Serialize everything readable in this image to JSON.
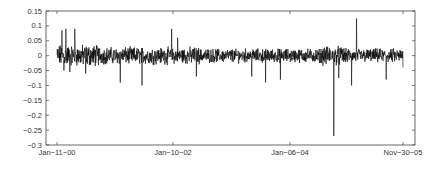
{
  "chart_data": {
    "type": "line",
    "title": "",
    "xlabel": "",
    "ylabel": "",
    "ylim": [
      -0.3,
      0.15
    ],
    "yticks": [
      0.15,
      0.1,
      0.05,
      0,
      -0.05,
      -0.1,
      -0.15,
      -0.2,
      -0.25,
      -0.3
    ],
    "ytick_labels": [
      "0.15",
      "0.1",
      "0.05",
      "0",
      "-0.05",
      "-0.1",
      "-0.15",
      "-0.2",
      "-0.25",
      "-0.3"
    ],
    "xticks": [
      "Jan-11-00",
      "Jan-10-02",
      "Jan-06-04",
      "Nov-30-05"
    ],
    "grid": false,
    "legend": null,
    "series": [
      {
        "name": "daily returns",
        "color": "#000000",
        "description": "Noisy daily return series fluctuating around 0 (mostly within ±0.05) from Jan-11-00 to Nov-30-05",
        "notable_points": [
          {
            "x": "early 2000",
            "y": 0.085
          },
          {
            "x": "early 2000",
            "y": 0.09
          },
          {
            "x": "late 2001",
            "y": 0.09
          },
          {
            "x": "mid 2001",
            "y": -0.09
          },
          {
            "x": "early 2002",
            "y": -0.1
          },
          {
            "x": "early 2005",
            "y": -0.27
          },
          {
            "x": "mid 2005",
            "y": 0.125
          },
          {
            "x": "mid 2005",
            "y": -0.11
          },
          {
            "x": "late 2005",
            "y": -0.08
          }
        ]
      }
    ]
  },
  "axes": {
    "x_tick_labels": [
      "Jan-11-00",
      "Jan-10-02",
      "Jan-06-04",
      "Nov-30-05"
    ],
    "y_tick_labels": [
      "0.15",
      "0.1",
      "0.05",
      "0",
      "-0.05",
      "-0.1",
      "-0.15",
      "-0.2",
      "-0.25",
      "-0.3"
    ]
  }
}
